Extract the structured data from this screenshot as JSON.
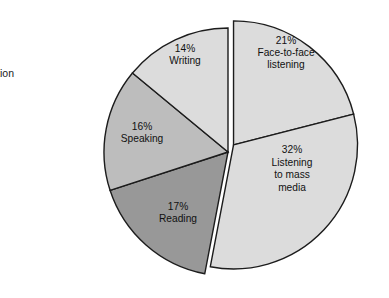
{
  "caption": {
    "line1": "d",
    "line2": "unication"
  },
  "chart_data": {
    "type": "pie",
    "title": "",
    "subtitle": "",
    "xlabel": "",
    "ylabel": "",
    "grid": false,
    "legend": "none",
    "labels_position": "inside-slice",
    "total": 100,
    "units": "%",
    "categories": [
      "Face-to-face listening",
      "Listening to mass media",
      "Reading",
      "Speaking",
      "Writing"
    ],
    "values": [
      21,
      32,
      17,
      16,
      14
    ],
    "slices": [
      {
        "percent_label": "21%",
        "name_lines": [
          "Face-to-face",
          "listening"
        ],
        "value": 21,
        "color": "#dcdcdc",
        "exploded": true,
        "start_angle": 0,
        "end_angle": 75.6,
        "label_x": 286,
        "label_y": 56
      },
      {
        "percent_label": "32%",
        "name_lines": [
          "Listening",
          "to mass",
          "media"
        ],
        "value": 32,
        "color": "#dcdcdc",
        "exploded": true,
        "start_angle": 75.6,
        "end_angle": 190.8,
        "label_x": 292,
        "label_y": 172
      },
      {
        "percent_label": "17%",
        "name_lines": [
          "Reading"
        ],
        "value": 17,
        "color": "#989898",
        "exploded": false,
        "start_angle": 190.8,
        "end_angle": 252.0,
        "label_x": 178,
        "label_y": 216
      },
      {
        "percent_label": "16%",
        "name_lines": [
          "Speaking"
        ],
        "value": 16,
        "color": "#bdbdbd",
        "exploded": false,
        "start_angle": 252.0,
        "end_angle": 309.6,
        "label_x": 142,
        "label_y": 136
      },
      {
        "percent_label": "14%",
        "name_lines": [
          "Writing"
        ],
        "value": 14,
        "color": "#dcdcdc",
        "exploded": false,
        "start_angle": 309.6,
        "end_angle": 360,
        "label_x": 185,
        "label_y": 58
      }
    ],
    "geometry": {
      "center_x": 228,
      "center_y": 152,
      "radius": 124,
      "explode_offset": 9,
      "explode_direction_deg": 38
    },
    "colors": {
      "outline": "#1c1c1c",
      "light_gray": "#dcdcdc",
      "medium_gray": "#bdbdbd",
      "dark_gray": "#989898",
      "background": "#ffffff",
      "text": "#111111"
    }
  }
}
